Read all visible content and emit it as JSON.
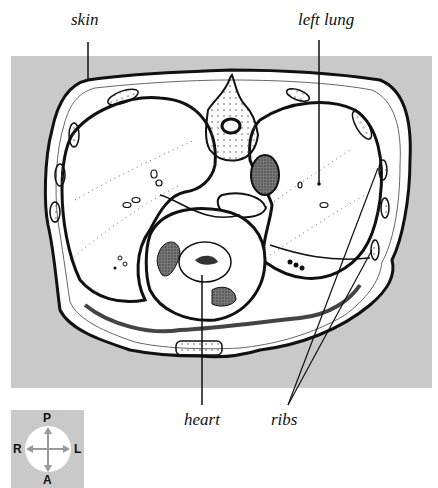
{
  "figure": {
    "background_color": "#c9c9c9",
    "labels": {
      "skin": "skin",
      "left_lung": "left lung",
      "heart": "heart",
      "ribs": "ribs"
    }
  },
  "orientation_key": {
    "posterior": "P",
    "anterior": "A",
    "right": "R",
    "left": "L"
  }
}
